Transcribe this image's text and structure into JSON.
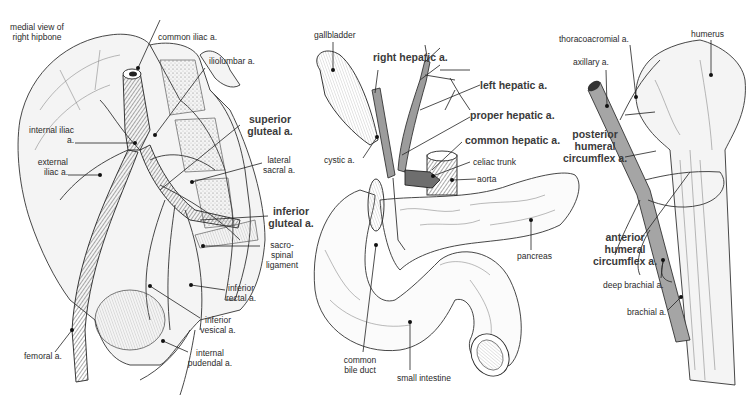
{
  "panels": {
    "pelvis": {
      "labels": {
        "medial_view": "medial view of right hipbone",
        "common_iliac": "common iliac a.",
        "iliolumbar": "iliolumbar a.",
        "superior_gluteal": "superior gluteal a.",
        "internal_iliac": "internal iliac a.",
        "external_iliac": "external iliac a.",
        "lateral_sacral": "lateral sacral a.",
        "inferior_gluteal": "inferior gluteal a.",
        "sacrospinal": "sacro-spinal ligament",
        "inferior_rectal": "inferior rectal a.",
        "inferior_vesical": "inferior vesical a.",
        "femoral": "femoral a.",
        "internal_pudendal": "internal pudendal a."
      }
    },
    "abdomen": {
      "labels": {
        "gallbladder": "gallbladder",
        "right_hepatic": "right hepatic a.",
        "left_hepatic": "left hepatic a.",
        "proper_hepatic": "proper hepatic a.",
        "common_hepatic": "common hepatic a.",
        "cystic": "cystic a.",
        "celiac_trunk": "celiac trunk",
        "aorta": "aorta",
        "pancreas": "pancreas",
        "common_bile_duct": "common bile duct",
        "small_intestine": "small intestine"
      }
    },
    "shoulder": {
      "labels": {
        "thoracoacromial": "thoracoacromial a.",
        "humerus": "humerus",
        "axillary": "axillary a.",
        "posterior_humeral_circumflex": "posterior humeral circumflex a.",
        "anterior_humeral_circumflex": "anterior humeral circumflex a.",
        "deep_brachial": "deep brachial a.",
        "brachial": "brachial a."
      }
    }
  }
}
